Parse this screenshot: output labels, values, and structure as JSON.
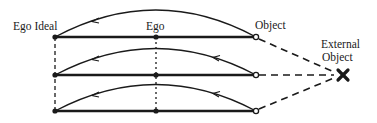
{
  "diagram": {
    "labels": {
      "ego_ideal": "Ego Ideal",
      "ego": "Ego",
      "object": "Object",
      "external_object_line1": "External",
      "external_object_line2": "Object"
    },
    "rows": [
      {
        "name": "row-1",
        "nodes": [
          "Ego Ideal",
          "Ego",
          "Object"
        ]
      },
      {
        "name": "row-2",
        "nodes": [
          "Ego Ideal",
          "Ego",
          "Object"
        ]
      },
      {
        "name": "row-3",
        "nodes": [
          "Ego Ideal",
          "Ego",
          "Object"
        ]
      }
    ],
    "colors": {
      "ink": "#1a1a1a",
      "background": "#ffffff"
    }
  }
}
